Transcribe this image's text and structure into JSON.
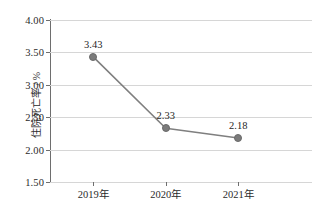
{
  "chart_data": {
    "type": "line",
    "title": "",
    "xlabel": "",
    "ylabel": "住院死亡率 / %",
    "categories": [
      "2019年",
      "2020年",
      "2021年"
    ],
    "values": [
      3.43,
      2.33,
      2.18
    ],
    "point_labels": [
      "3.43",
      "2.33",
      "2.18"
    ],
    "ylim": [
      1.5,
      4.0
    ],
    "ytick_values": [
      1.5,
      2.0,
      2.5,
      3.0,
      3.5,
      4.0
    ],
    "ytick_labels": [
      "1.50",
      "2.00",
      "2.50",
      "3.00",
      "3.50",
      "4.00"
    ],
    "grid": true,
    "legend": "none",
    "series": [
      {
        "name": "住院死亡率",
        "values": [
          3.43,
          2.33,
          2.18
        ],
        "line_color": "#7f7f7f",
        "marker_color": "#7b7b7b",
        "marker_shape": "circle"
      }
    ],
    "colors": {
      "background": "#ffffff",
      "gridline": "#d6d6d6",
      "axis": "#6e6e6e",
      "text": "#2b2b2b",
      "series": "#7f7f7f"
    }
  }
}
